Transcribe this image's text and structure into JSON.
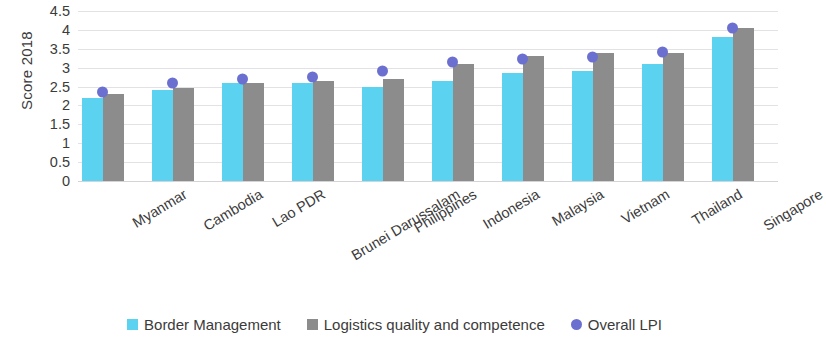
{
  "chart_data": {
    "type": "bar",
    "title": "",
    "xlabel": "",
    "ylabel": "Score 2018",
    "ylim": [
      0,
      4.5
    ],
    "ytick_step": 0.5,
    "grid": true,
    "legend_position": "bottom",
    "categories": [
      "Myanmar",
      "Cambodia",
      "Lao PDR",
      "Brunei Darussalam",
      "Philippines",
      "Indonesia",
      "Malaysia",
      "Vietnam",
      "Thailand",
      "Singapore"
    ],
    "ytick_labels": [
      "4.5",
      "4",
      "3.5",
      "3",
      "2.5",
      "2",
      "1.5",
      "1",
      "0.5",
      "0"
    ],
    "ytick_values": [
      4.5,
      4,
      3.5,
      3,
      2.5,
      2,
      1.5,
      1,
      0.5,
      0
    ],
    "series": [
      {
        "name": "Border Management",
        "type": "bar",
        "color": "#5BD3F0",
        "values": [
          2.2,
          2.4,
          2.6,
          2.6,
          2.5,
          2.65,
          2.85,
          2.9,
          3.1,
          3.8
        ]
      },
      {
        "name": "Logistics quality and competence",
        "type": "bar",
        "color": "#8C8C8C",
        "values": [
          2.3,
          2.45,
          2.6,
          2.65,
          2.7,
          3.1,
          3.3,
          3.4,
          3.4,
          4.05
        ]
      },
      {
        "name": "Overall LPI",
        "type": "scatter",
        "color": "#6A6FD0",
        "values": [
          2.35,
          2.6,
          2.7,
          2.75,
          2.9,
          3.15,
          3.22,
          3.27,
          3.41,
          4.05
        ]
      }
    ]
  },
  "legend": {
    "items": [
      {
        "label": "Border Management",
        "marker": "square",
        "color": "#5BD3F0"
      },
      {
        "label": "Logistics quality and competence",
        "marker": "square",
        "color": "#8C8C8C"
      },
      {
        "label": "Overall LPI",
        "marker": "circle",
        "color": "#6A6FD0"
      }
    ]
  }
}
